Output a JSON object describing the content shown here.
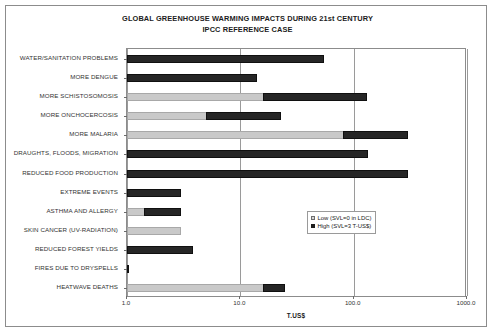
{
  "chart_data": {
    "type": "bar",
    "orientation": "horizontal",
    "stacked": true,
    "title": "GLOBAL GREENHOUSE WARMING IMPACTS DURING 21st CENTURY",
    "subtitle": "IPCC REFERENCE CASE",
    "xlabel": "T.US$",
    "ylabel": "",
    "xscale": "log",
    "xlim": [
      1.0,
      1000.0
    ],
    "xticks": [
      1.0,
      10.0,
      100.0,
      1000.0
    ],
    "xtick_labels": [
      "1.0",
      "10.0",
      "100.0",
      "1000.0"
    ],
    "grid": "vertical",
    "legend_position": "inside-right",
    "categories": [
      "WATER/SANITATION PROBLEMS",
      "MORE DENGUE",
      "MORE SCHISTOSOMOSIS",
      "MORE ONCHOCERCOSIS",
      "MORE MALARIA",
      "DRAUGHTS, FLOODS, MIGRATION",
      "REDUCED FOOD PRODUCTION",
      "EXTREME EVENTS",
      "ASTHMA AND ALLERGY",
      "SKIN CANCER (UV-RADIATION)",
      "REDUCED FOREST YIELDS",
      "FIRES DUE TO DRYSPELLS",
      "HEATWAVE DEATHS"
    ],
    "series": [
      {
        "name": "Low (SVL=0 in LDC)",
        "color": "#c9c9c9",
        "values": [
          1.0,
          1.0,
          16.0,
          5.0,
          80.0,
          1.0,
          1.0,
          1.0,
          1.4,
          3.0,
          1.0,
          1.0,
          16.0
        ]
      },
      {
        "name": "High (SVL=3 T-US$)",
        "color": "#262626",
        "values": [
          55.0,
          14.0,
          130.0,
          23.0,
          300.0,
          135.0,
          300.0,
          3.0,
          3.0,
          3.0,
          3.8,
          1.05,
          25.0
        ]
      }
    ],
    "legend": [
      {
        "label": "Low (SVL=0 in LDC)",
        "swatch": "light-gray"
      },
      {
        "label": "High (SVL=3 T-US$)",
        "swatch": "black"
      }
    ]
  }
}
